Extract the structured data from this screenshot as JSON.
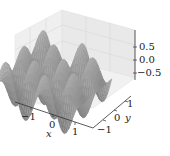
{
  "chart_data": {
    "type": "surface3d",
    "title": "",
    "xlabel": "x",
    "ylabel": "y",
    "zlabel": "",
    "xlim": [
      -1.5,
      1.5
    ],
    "ylim": [
      -1.5,
      1.5
    ],
    "zlim": [
      -1,
      1
    ],
    "x_ticks": [
      "−1",
      "0",
      "1"
    ],
    "y_ticks": [
      "−1",
      "0",
      "1"
    ],
    "z_ticks": [
      "0.5",
      "0.0",
      "−0.5"
    ],
    "grid": true,
    "colormap": "gray",
    "pane_color": "#ececec",
    "surface_colors": {
      "light": "#b8b8b8",
      "mid": "#8a8a8a",
      "dark": "#4a4a4a"
    }
  }
}
